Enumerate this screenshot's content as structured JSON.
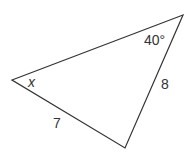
{
  "diagram": {
    "type": "triangle",
    "vertices": {
      "left": [
        12,
        80
      ],
      "top_right": [
        183,
        15
      ],
      "bottom": [
        125,
        148
      ]
    },
    "labels": {
      "angle_left": "x",
      "angle_top_right": "40°",
      "side_right": "8",
      "side_bottom_left": "7"
    },
    "colors": {
      "stroke": "#333333",
      "text": "#333333"
    }
  }
}
